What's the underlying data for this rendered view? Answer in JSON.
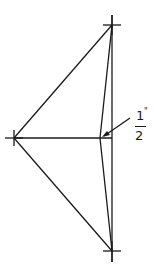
{
  "diagram": {
    "type": "geometric-construction",
    "stroke_color": "#1a1a1a",
    "background": "#ffffff",
    "points": {
      "top": {
        "x": 112,
        "y": 25
      },
      "left": {
        "x": 14,
        "y": 138
      },
      "bottom": {
        "x": 112,
        "y": 251
      },
      "inner": {
        "x": 100,
        "y": 138
      }
    },
    "annotation": {
      "numerator": "1",
      "denominator": "2",
      "unit": "\"",
      "meaning": "1/2 inch offset"
    }
  }
}
